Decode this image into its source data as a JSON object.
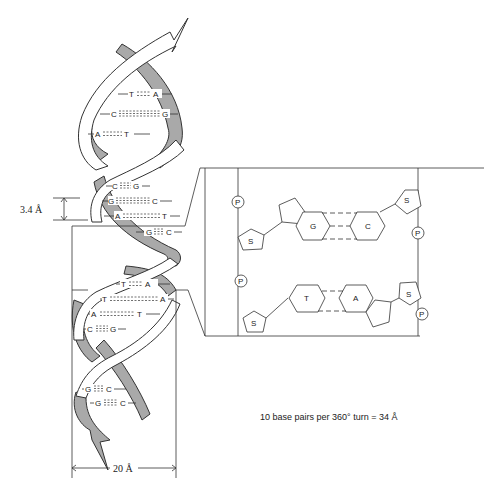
{
  "figure": {
    "helix": {
      "base_pairs": [
        {
          "left": "T",
          "right": "A",
          "bonds": 2
        },
        {
          "left": "C",
          "right": "G",
          "bonds": 3
        },
        {
          "left": "A",
          "right": "T",
          "bonds": 2
        },
        {
          "left": "C",
          "right": "G",
          "bonds": 3
        },
        {
          "left": "G",
          "right": "C",
          "bonds": 3
        },
        {
          "left": "A",
          "right": "T",
          "bonds": 2
        },
        {
          "left": "G",
          "right": "C",
          "bonds": 3
        },
        {
          "left": "T",
          "right": "A",
          "bonds": 2
        },
        {
          "left": "T",
          "right": "A",
          "bonds": 2
        },
        {
          "left": "A",
          "right": "T",
          "bonds": 2
        },
        {
          "left": "C",
          "right": "G",
          "bonds": 3
        },
        {
          "left": "G",
          "right": "C",
          "bonds": 3
        },
        {
          "left": "G",
          "right": "C",
          "bonds": 3
        }
      ],
      "pitch_label": "3.4 Å",
      "width_label": "20 Å"
    },
    "detail": {
      "top_pair": {
        "left": "G",
        "right": "C"
      },
      "bottom_pair": {
        "left": "T",
        "right": "A"
      },
      "sugar_label": "S",
      "phosphate_label": "P"
    },
    "caption": "10 base pairs per 360° turn = 34 Å"
  }
}
